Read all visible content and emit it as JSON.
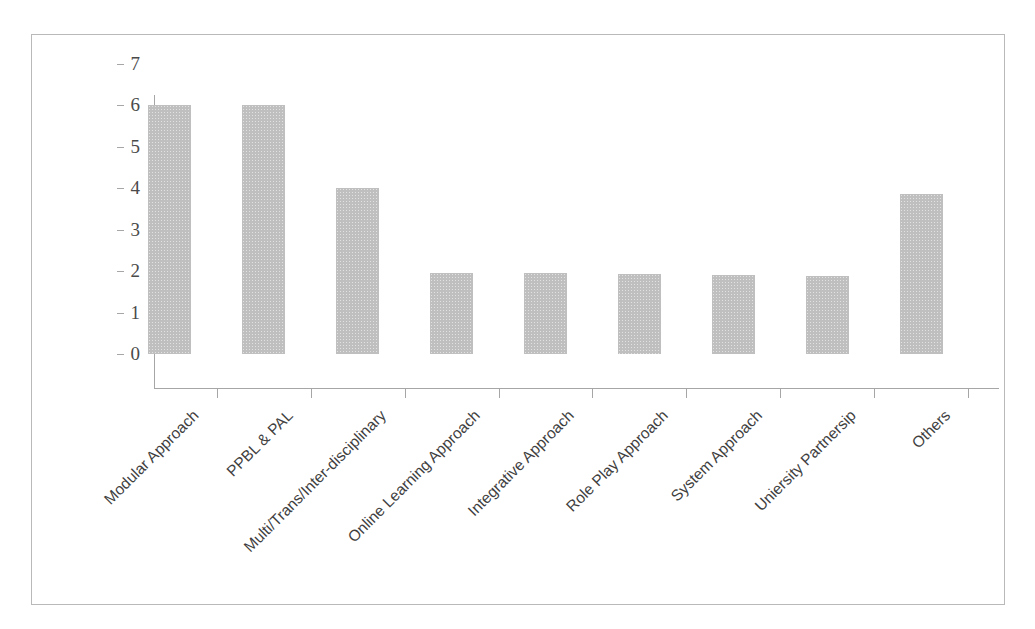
{
  "chart_data": {
    "type": "bar",
    "title": "",
    "subtitle": "",
    "xlabel": "",
    "ylabel": "",
    "ylim": [
      0,
      7
    ],
    "yticks": [
      0,
      1,
      2,
      3,
      4,
      5,
      6,
      7
    ],
    "grid": false,
    "legend": false,
    "legend_position": "none",
    "bar_color": "#bfbfbf",
    "axis_color": "#a6a6a6",
    "categories": [
      "Modular Approach",
      "PPBL & PAL",
      "Multi/Trans/Inter-disciplinary",
      "Online Learning Approach",
      "Integrative Approach",
      "Role Play Approach",
      "System Approach",
      "Uniersity Partnersip",
      "Others"
    ],
    "values": [
      6,
      6,
      4,
      1.95,
      1.95,
      1.92,
      1.9,
      1.88,
      3.86
    ],
    "annotations": []
  },
  "figure": {
    "border_color": "#b9b9b9",
    "background": "#ffffff"
  }
}
